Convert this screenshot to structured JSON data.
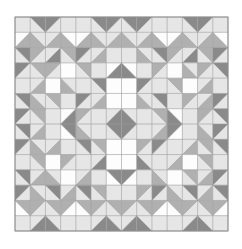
{
  "figure": {
    "kind": "quilt-block-pattern",
    "canvas": {
      "width": 242,
      "height": 249,
      "background": "#ffffff"
    },
    "block": {
      "x": 15,
      "y": 17,
      "width": 213,
      "height": 214
    },
    "grid": {
      "cols": 14,
      "rows": 14
    },
    "palette": {
      "white": "#fdfdfd",
      "light": "#e6e6e6",
      "medium": "#b0b0b0",
      "dark": "#8a8a8a",
      "gridline": "#9a9a9a",
      "border": "#8a8a8a"
    },
    "shade_keys": [
      "white",
      "light",
      "medium",
      "dark"
    ],
    "cells": [
      [
        "1|full",
        "3|tr+1|bl",
        "3|tl+1|br",
        "1|full",
        "1|full",
        "3|tr+1|bl",
        "3|tl+1|br",
        "3|tr+1|bl",
        "3|tl+1|br",
        "1|full",
        "1|full",
        "3|tr+1|bl",
        "3|tl+1|br",
        "1|full"
      ],
      [
        "2|br+0|tl",
        "2|bl+1|tr",
        "2|br+1|tl",
        "2|bl+0|tr",
        "2|br+0|tl",
        "2|bl+1|tr",
        "2|br+1|tl",
        "2|bl+1|tr",
        "2|br+1|tl",
        "2|bl+0|tr",
        "2|br+0|tl",
        "2|bl+1|tr",
        "2|br+1|tl",
        "2|bl+0|tr"
      ],
      [
        "3|tr+1|bl",
        "2|tl+1|br",
        "3|br+1|tl",
        "2|tr+1|bl",
        "3|tl+1|br",
        "2|br+1|tl",
        "1|full",
        "1|full",
        "2|bl+1|tr",
        "3|tr+1|bl",
        "2|tl+1|br",
        "3|br+1|tl",
        "2|tr+1|bl",
        "3|tl+1|br"
      ],
      [
        "3|tl+1|br",
        "2|tr+1|bl",
        "2|tl+1|br",
        "0|full",
        "2|tr+1|bl",
        "1|full",
        "3|br+0|tl",
        "3|bl+0|tr",
        "1|full",
        "2|tl+1|br",
        "0|full",
        "2|bl+1|tr",
        "2|tl+1|br",
        "3|tr+1|bl"
      ],
      [
        "1|full",
        "2|br+1|tl",
        "0|full",
        "2|bl+1|tr",
        "1|full",
        "3|tr+1|bl",
        "0|full",
        "0|full",
        "3|tl+1|br",
        "1|full",
        "2|tr+1|bl",
        "0|full",
        "2|br+1|tl",
        "1|full"
      ],
      [
        "3|tr+1|bl",
        "2|bl+1|tr",
        "2|tr+1|bl",
        "1|full",
        "3|tl+1|br",
        "2|br+1|tl",
        "0|full",
        "0|full",
        "2|bl+1|tr",
        "3|tr+1|bl",
        "1|full",
        "2|tl+1|br",
        "2|br+1|tl",
        "3|tl+1|br"
      ],
      [
        "3|tl+1|br",
        "2|tr+1|bl",
        "1|full",
        "3|br+0|tl",
        "2|tl+1|br",
        "1|full",
        "3|br+1|tl",
        "3|bl+1|tr",
        "1|full",
        "2|tr+1|bl",
        "3|bl+0|tr",
        "1|full",
        "2|tl+1|br",
        "3|tr+1|bl"
      ],
      [
        "3|tr+1|bl",
        "2|br+1|tl",
        "1|full",
        "3|tr+0|bl",
        "2|bl+1|tr",
        "1|full",
        "3|tr+1|bl",
        "3|tl+1|br",
        "1|full",
        "2|br+1|tl",
        "3|tl+0|br",
        "1|full",
        "2|bl+1|tr",
        "3|tl+1|br"
      ],
      [
        "3|tl+1|br",
        "2|bl+1|tr",
        "2|br+1|tl",
        "1|full",
        "3|tr+1|bl",
        "2|tr+1|bl",
        "0|full",
        "0|full",
        "2|tl+1|br",
        "3|tl+1|br",
        "1|full",
        "2|br+1|tl",
        "2|tr+1|bl",
        "3|tr+1|bl"
      ],
      [
        "1|full",
        "2|tr+1|bl",
        "0|full",
        "2|tl+1|br",
        "1|full",
        "3|br+1|tl",
        "0|full",
        "0|full",
        "3|bl+1|tr",
        "1|full",
        "2|br+1|tl",
        "0|full",
        "2|tr+1|bl",
        "1|full"
      ],
      [
        "3|tr+1|bl",
        "2|br+1|tl",
        "2|bl+1|tr",
        "0|full",
        "2|br+1|tl",
        "1|full",
        "3|tr+0|bl",
        "3|tl+0|br",
        "1|full",
        "2|bl+1|tr",
        "0|full",
        "2|tr+1|bl",
        "2|br+1|tl",
        "3|tl+1|br"
      ],
      [
        "3|tl+1|br",
        "2|bl+1|tr",
        "3|tr+1|bl",
        "2|br+1|tl",
        "3|tr+1|bl",
        "2|tr+1|bl",
        "1|full",
        "1|full",
        "2|tl+1|br",
        "3|tl+1|br",
        "2|bl+1|tr",
        "3|tr+1|bl",
        "2|br+1|tl",
        "3|tr+1|bl"
      ],
      [
        "2|tr+0|bl",
        "2|tl+1|br",
        "2|tr+1|bl",
        "2|tl+0|br",
        "2|tr+0|bl",
        "2|tl+1|br",
        "2|tr+1|bl",
        "2|tl+1|br",
        "2|tr+1|bl",
        "2|tl+0|br",
        "2|tr+0|bl",
        "2|tl+1|br",
        "2|tr+1|bl",
        "2|tl+0|br"
      ],
      [
        "1|full",
        "3|br+1|tl",
        "3|bl+1|tr",
        "1|full",
        "1|full",
        "3|br+1|tl",
        "3|bl+1|tr",
        "3|br+1|tl",
        "3|bl+1|tr",
        "1|full",
        "1|full",
        "3|br+1|tl",
        "3|bl+1|tr",
        "1|full"
      ]
    ]
  }
}
